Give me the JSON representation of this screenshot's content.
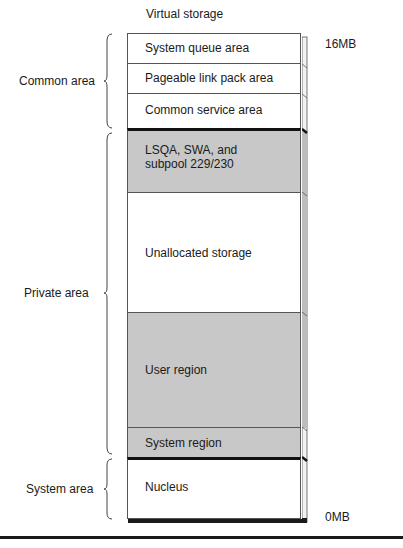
{
  "diagram": {
    "title": "Virtual storage",
    "top_mark": "16MB",
    "bottom_mark": "0MB",
    "groups": [
      {
        "label": "Common area"
      },
      {
        "label": "Private area"
      },
      {
        "label": "System area"
      }
    ],
    "segments": [
      {
        "label": "System queue area",
        "fill": "#ffffff"
      },
      {
        "label": "Pageable link pack area",
        "fill": "#ffffff"
      },
      {
        "label": "Common service area",
        "fill": "#ffffff"
      },
      {
        "label_line1": "LSQA, SWA, and",
        "label_line2": "subpool 229/230",
        "fill": "#c8c8c8"
      },
      {
        "label": "Unallocated storage",
        "fill": "#ffffff"
      },
      {
        "label": "User region",
        "fill": "#c8c8c8"
      },
      {
        "label": "System region",
        "fill": "#c8c8c8"
      },
      {
        "label": "Nucleus",
        "fill": "#ffffff"
      }
    ]
  }
}
